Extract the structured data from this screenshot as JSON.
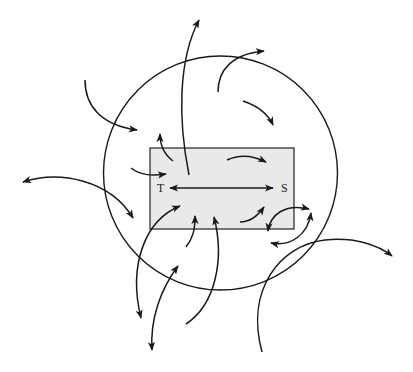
{
  "diagram": {
    "labels": {
      "left": "T",
      "right": "S"
    },
    "colors": {
      "stroke": "#1a1a1a",
      "box_fill": "#e9e9e9",
      "background": "#ffffff"
    },
    "shapes": {
      "circle": {
        "cx": 220.5,
        "cy": 173,
        "r": 117
      },
      "box": {
        "x": 150,
        "y": 148,
        "width": 144,
        "height": 81
      }
    },
    "elements": [
      "central-double-arrow-T-to-S",
      "circle-boundary",
      "shaded-rectangle",
      "multiple curved arrows crossing boundary"
    ]
  }
}
